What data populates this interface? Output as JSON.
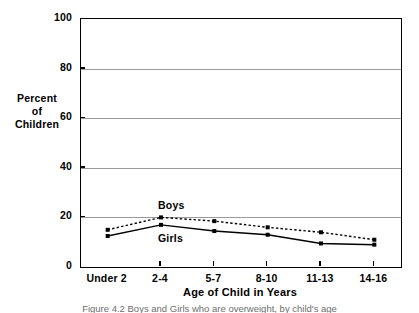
{
  "chart_data": {
    "type": "line",
    "title": "",
    "xlabel": "Age of Child in Years",
    "ylabel": "Percent of Children",
    "ylabel_lines": [
      "Percent",
      "of",
      "Children"
    ],
    "categories": [
      "Under 2",
      "2-4",
      "5-7",
      "8-10",
      "11-13",
      "14-16"
    ],
    "yticks": [
      0,
      20,
      40,
      60,
      80,
      100
    ],
    "ylim": [
      0,
      100
    ],
    "grid": true,
    "legend_position": "inline-annotation",
    "series": [
      {
        "name": "Boys",
        "style": "dotted",
        "color": "#000000",
        "values": [
          15,
          20,
          18.5,
          16,
          14,
          11
        ]
      },
      {
        "name": "Girls",
        "style": "solid",
        "color": "#000000",
        "values": [
          12.5,
          17,
          14.5,
          13,
          9.5,
          9
        ]
      }
    ],
    "annotations": [
      {
        "text": "Boys",
        "category": "2-4",
        "value": 24
      },
      {
        "text": "Girls",
        "category": "2-4",
        "value": 11
      }
    ]
  },
  "caption": {
    "text": "Figure 4.2   Boys and Girls who are overweight, by child's age"
  }
}
